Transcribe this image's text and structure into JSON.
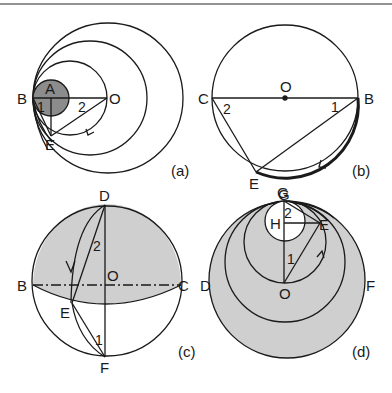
{
  "figure": {
    "colors": {
      "stroke": "#1a1a1a",
      "shade_dark": "#8c8c8c",
      "shade_light": "#cfcfcf",
      "background": "#ffffff",
      "top_rule": "#6e6e6e"
    },
    "panels": [
      {
        "id": "a",
        "caption": "(a)",
        "points": {
          "A": "A",
          "B": "B",
          "O": "O",
          "E": "E"
        },
        "angles": {
          "one": "1",
          "two": "2"
        }
      },
      {
        "id": "b",
        "caption": "(b)",
        "points": {
          "O": "O",
          "C": "C",
          "B": "B",
          "E": "E",
          "G": "G"
        },
        "angles": {
          "one": "1",
          "two": "2"
        }
      },
      {
        "id": "c",
        "caption": "(c)",
        "points": {
          "D": "D",
          "B": "B",
          "O": "O",
          "C": "C",
          "E": "E",
          "F": "F"
        },
        "angles": {
          "one": "1",
          "two": "2"
        }
      },
      {
        "id": "d",
        "caption": "(d)",
        "points": {
          "G": "G",
          "H": "H",
          "E": "E",
          "D": "D",
          "O": "O",
          "F": "F"
        },
        "angles": {
          "one": "1",
          "two": "2"
        }
      }
    ]
  }
}
